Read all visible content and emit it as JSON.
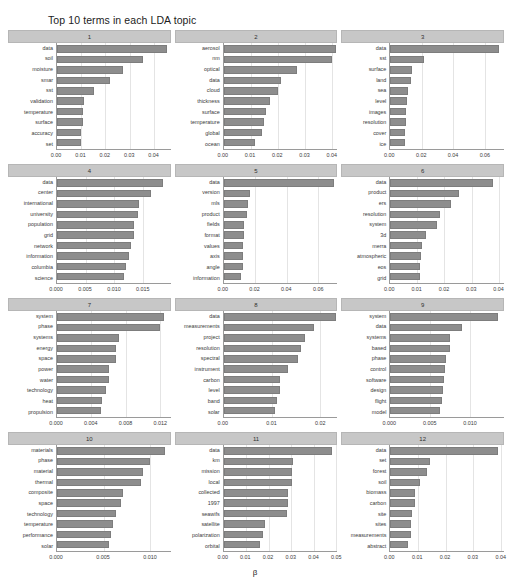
{
  "title": "Top 10 terms in each LDA topic",
  "xlabel": "β",
  "colors": {
    "bar": "#8d8d8d",
    "strip": "#c7c7c7",
    "grid": "#e4e4e4",
    "axis": "#9a9a9a",
    "text": "#2b2b2b",
    "background": "#ffffff"
  },
  "chart_data": {
    "type": "bar",
    "title": "Top 10 terms in each LDA topic",
    "xlabel": "β",
    "ylabel": "",
    "orientation": "horizontal",
    "grid": true,
    "legend": "none",
    "facets": [
      {
        "strip": "1",
        "xlim": [
          0,
          0.047
        ],
        "xticks": [
          0.0,
          0.01,
          0.02,
          0.03,
          0.04
        ],
        "xticklabels": [
          "0.00",
          "0.01",
          "0.02",
          "0.03",
          "0.04"
        ],
        "categories": [
          "data",
          "soil",
          "moisture",
          "smar",
          "sst",
          "validation",
          "temperature",
          "surface",
          "accuracy",
          "set"
        ],
        "values": [
          0.0455,
          0.0355,
          0.0272,
          0.0218,
          0.0152,
          0.0113,
          0.0108,
          0.0106,
          0.01,
          0.0098
        ]
      },
      {
        "strip": "2",
        "xlim": [
          0,
          0.042
        ],
        "xticks": [
          0.0,
          0.01,
          0.02,
          0.03,
          0.04
        ],
        "xticklabels": [
          "0.00",
          "0.01",
          "0.02",
          "0.03",
          "0.04"
        ],
        "categories": [
          "aerosol",
          "nm",
          "optical",
          "data",
          "cloud",
          "thickness",
          "surface",
          "temperature",
          "global",
          "ocean"
        ],
        "values": [
          0.0415,
          0.0402,
          0.0272,
          0.0212,
          0.0202,
          0.017,
          0.0158,
          0.0148,
          0.0142,
          0.0117
        ]
      },
      {
        "strip": "3",
        "xlim": [
          0,
          0.072
        ],
        "xticks": [
          0.0,
          0.02,
          0.04,
          0.06
        ],
        "xticklabels": [
          "0.00",
          "0.02",
          "0.04",
          "0.06"
        ],
        "categories": [
          "data",
          "sst",
          "surface",
          "land",
          "sea",
          "level",
          "images",
          "resolution",
          "cover",
          "ice"
        ],
        "values": [
          0.069,
          0.0212,
          0.014,
          0.0128,
          0.011,
          0.0105,
          0.01,
          0.0098,
          0.0094,
          0.009
        ]
      },
      {
        "strip": "4",
        "xlim": [
          0,
          0.0198
        ],
        "xticks": [
          0.0,
          0.005,
          0.01,
          0.015
        ],
        "xticklabels": [
          "0.000",
          "0.005",
          "0.010",
          "0.015"
        ],
        "categories": [
          "data",
          "center",
          "international",
          "university",
          "population",
          "grid",
          "network",
          "information",
          "columbia",
          "science"
        ],
        "values": [
          0.0184,
          0.0163,
          0.0143,
          0.0141,
          0.0134,
          0.0134,
          0.0129,
          0.0125,
          0.012,
          0.0117
        ]
      },
      {
        "strip": "5",
        "xlim": [
          0,
          0.072
        ],
        "xticks": [
          0.0,
          0.02,
          0.04,
          0.06
        ],
        "xticklabels": [
          "0.00",
          "0.02",
          "0.04",
          "0.06"
        ],
        "categories": [
          "data",
          "version",
          "mls",
          "product",
          "fields",
          "format",
          "values",
          "axis",
          "angle",
          "information"
        ],
        "values": [
          0.0702,
          0.0165,
          0.0152,
          0.0149,
          0.0131,
          0.013,
          0.0125,
          0.0122,
          0.012,
          0.0113
        ]
      },
      {
        "strip": "6",
        "xlim": [
          0,
          0.042
        ],
        "xticks": [
          0.0,
          0.01,
          0.02,
          0.03,
          0.04
        ],
        "xticklabels": [
          "0.00",
          "0.01",
          "0.02",
          "0.03",
          "0.04"
        ],
        "categories": [
          "data",
          "product",
          "ers",
          "resolution",
          "system",
          "3d",
          "merra",
          "atmospheric",
          "eos",
          "grid"
        ],
        "values": [
          0.0381,
          0.0255,
          0.0224,
          0.0184,
          0.0171,
          0.0131,
          0.0118,
          0.0115,
          0.011,
          0.011
        ]
      },
      {
        "strip": "7",
        "xlim": [
          0,
          0.0132
        ],
        "xticks": [
          0.0,
          0.004,
          0.008,
          0.012
        ],
        "xticklabels": [
          "0.000",
          "0.004",
          "0.008",
          "0.012"
        ],
        "categories": [
          "system",
          "phase",
          "systems",
          "energy",
          "space",
          "power",
          "water",
          "technology",
          "heat",
          "propulsion"
        ],
        "values": [
          0.0124,
          0.012,
          0.0072,
          0.0069,
          0.0068,
          0.006,
          0.006,
          0.0057,
          0.0052,
          0.0051
        ]
      },
      {
        "strip": "8",
        "xlim": [
          0,
          0.0235
        ],
        "xticks": [
          0.0,
          0.01,
          0.02
        ],
        "xticklabels": [
          "0.00",
          "0.01",
          "0.02"
        ],
        "categories": [
          "data",
          "measurements",
          "project",
          "resolution",
          "spectral",
          "instrument",
          "carbon",
          "level",
          "band",
          "solar"
        ],
        "values": [
          0.0232,
          0.0186,
          0.0168,
          0.016,
          0.0154,
          0.0132,
          0.0117,
          0.0116,
          0.011,
          0.0106
        ]
      },
      {
        "strip": "9",
        "xlim": [
          0,
          0.0142
        ],
        "xticks": [
          0.0,
          0.005,
          0.01
        ],
        "xticklabels": [
          "0.000",
          "0.005",
          "0.010"
        ],
        "categories": [
          "system",
          "data",
          "systems",
          "based",
          "phase",
          "control",
          "software",
          "design",
          "flight",
          "model"
        ],
        "values": [
          0.0134,
          0.0089,
          0.0075,
          0.0074,
          0.0069,
          0.0068,
          0.0067,
          0.0066,
          0.0065,
          0.0062
        ]
      },
      {
        "strip": "10",
        "xlim": [
          0,
          0.0122
        ],
        "xticks": [
          0.0,
          0.005,
          0.01
        ],
        "xticklabels": [
          "0.000",
          "0.005",
          "0.010"
        ],
        "categories": [
          "materials",
          "phase",
          "material",
          "thermal",
          "composite",
          "space",
          "technology",
          "temperature",
          "performance",
          "solar"
        ],
        "values": [
          0.0116,
          0.01,
          0.0092,
          0.009,
          0.0071,
          0.0069,
          0.0063,
          0.006,
          0.0058,
          0.0056
        ]
      },
      {
        "strip": "11",
        "xlim": [
          0,
          0.0505
        ],
        "xticks": [
          0.0,
          0.01,
          0.02,
          0.03,
          0.04,
          0.05
        ],
        "xticklabels": [
          "0.00",
          "0.01",
          "0.02",
          "0.03",
          "0.04",
          "0.05"
        ],
        "categories": [
          "data",
          "km",
          "mission",
          "local",
          "collected",
          "1997",
          "seawifs",
          "satellite",
          "polarization",
          "orbital"
        ],
        "values": [
          0.0482,
          0.031,
          0.0305,
          0.0303,
          0.0288,
          0.0285,
          0.0281,
          0.0182,
          0.0174,
          0.0162
        ]
      },
      {
        "strip": "12",
        "xlim": [
          0,
          0.0412
        ],
        "xticks": [
          0.0,
          0.01,
          0.02,
          0.03,
          0.04
        ],
        "xticklabels": [
          "0.00",
          "0.01",
          "0.02",
          "0.03",
          "0.04"
        ],
        "categories": [
          "data",
          "set",
          "forest",
          "soil",
          "biomass",
          "carbon",
          "site",
          "sites",
          "measurements",
          "abstract"
        ],
        "values": [
          0.0392,
          0.0142,
          0.0134,
          0.0107,
          0.0091,
          0.009,
          0.0079,
          0.0076,
          0.0074,
          0.0063
        ]
      }
    ]
  }
}
